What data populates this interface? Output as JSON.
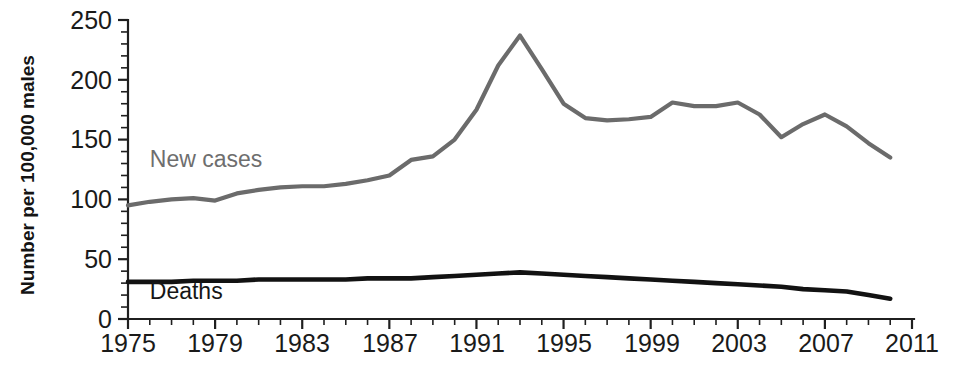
{
  "chart_data": {
    "type": "line",
    "title": "",
    "subtitle": "",
    "xlabel": "",
    "ylabel": "Number per 100,000 males",
    "xlim": [
      1975,
      2011
    ],
    "ylim": [
      0,
      250
    ],
    "ytick_labels": [
      "0",
      "50",
      "100",
      "150",
      "200",
      "250"
    ],
    "ytick_values": [
      0,
      50,
      100,
      150,
      200,
      250
    ],
    "y_minor_step": 10,
    "xtick_labels": [
      "1975",
      "1979",
      "1983",
      "1987",
      "1991",
      "1995",
      "1999",
      "2003",
      "2007",
      "2011"
    ],
    "xtick_values": [
      1975,
      1979,
      1983,
      1987,
      1991,
      1995,
      1999,
      2003,
      2007,
      2011
    ],
    "x_minor_step": 1,
    "grid": false,
    "legend": "inline-annotations",
    "x": [
      1975,
      1976,
      1977,
      1978,
      1979,
      1980,
      1981,
      1982,
      1983,
      1984,
      1985,
      1986,
      1987,
      1988,
      1989,
      1990,
      1991,
      1992,
      1993,
      1994,
      1995,
      1996,
      1997,
      1998,
      1999,
      2000,
      2001,
      2002,
      2003,
      2004,
      2005,
      2006,
      2007,
      2008,
      2009,
      2010
    ],
    "series": [
      {
        "name": "New cases",
        "color": "#6b6b6b",
        "label_x": 1976,
        "label_y": 127,
        "values": [
          95,
          98,
          100,
          101,
          99,
          105,
          108,
          110,
          111,
          111,
          113,
          116,
          120,
          133,
          136,
          150,
          175,
          212,
          237,
          209,
          180,
          168,
          166,
          167,
          169,
          181,
          178,
          178,
          181,
          171,
          152,
          163,
          171,
          161,
          147,
          135
        ]
      },
      {
        "name": "Deaths",
        "color": "#121212",
        "label_x": 1976,
        "label_y": 17,
        "values": [
          31,
          31,
          31,
          32,
          32,
          32,
          33,
          33,
          33,
          33,
          33,
          34,
          34,
          34,
          35,
          36,
          37,
          38,
          39,
          38,
          37,
          36,
          35,
          34,
          33,
          32,
          31,
          30,
          29,
          28,
          27,
          25,
          24,
          23,
          20,
          17
        ]
      }
    ]
  }
}
